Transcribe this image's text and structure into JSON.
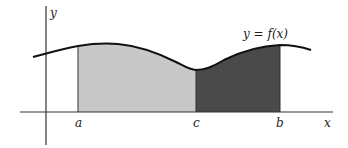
{
  "diagram": {
    "curve_label": "y = f(x)",
    "axis_labels": {
      "x": "x",
      "y": "y"
    },
    "points": {
      "a": "a",
      "c": "c",
      "b": "b"
    },
    "colors": {
      "curve": "#111111",
      "axes": "#333333",
      "region_a_to_c": "#c8c8c8",
      "region_c_to_b": "#4a4a4a",
      "background": "#ffffff"
    },
    "regions": [
      {
        "name": "region-a-to-c",
        "from": "a",
        "to": "c",
        "shade": "light"
      },
      {
        "name": "region-c-to-b",
        "from": "c",
        "to": "b",
        "shade": "dark"
      }
    ]
  }
}
